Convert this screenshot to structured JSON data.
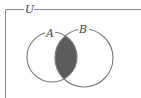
{
  "diagram": {
    "type": "venn",
    "universe_label": "U",
    "sets": [
      {
        "label": "A",
        "cx": 52,
        "cy": 57,
        "r": 25
      },
      {
        "label": "B",
        "cx": 84,
        "cy": 58,
        "r": 29
      }
    ],
    "shaded_region": "A ∩ B",
    "colors": {
      "stroke": "#7a7a7a",
      "frame": "#8a8a8a",
      "shade": "#5c5c5c",
      "background": "#ffffff"
    }
  }
}
